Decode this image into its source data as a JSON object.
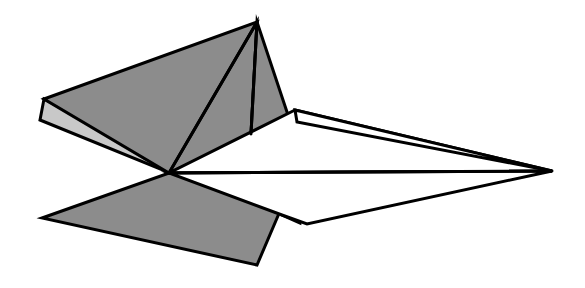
{
  "figure": {
    "style": "flat-shaded polygonal line drawing",
    "canvas": {
      "width": 585,
      "height": 288,
      "background": "#ffffff"
    },
    "palette": {
      "outline": "#000000",
      "shade_dark": "#8c8c8c",
      "shade_light": "#c8c8c8",
      "shade_white": "#ffffff"
    },
    "stroke_width": 3.0,
    "shapes": [
      {
        "name": "under-flap-light-sliver",
        "label": "Under flap (light gray sliver)",
        "fill": "#c8c8c8",
        "stroke": "#000000",
        "stroke_width": 3.0,
        "points": "40,120 170,173 174,168 44,99"
      },
      {
        "name": "upper-left-wing-dark",
        "label": "Upper left wing (dark gray)",
        "fill": "#8c8c8c",
        "stroke": "#000000",
        "stroke_width": 3.0,
        "points": "44,99 257,22 214,128 169,173"
      },
      {
        "name": "center-fin-left-panel",
        "label": "Center fin left panel (dark gray)",
        "fill": "#8c8c8c",
        "stroke": "#000000",
        "stroke_width": 3.0,
        "points": "257,22 251,134 169,173"
      },
      {
        "name": "center-fin-right-panel",
        "label": "Center fin right panel (dark gray)",
        "fill": "#8c8c8c",
        "stroke": "#000000",
        "stroke_width": 3.0,
        "points": "257,22 291,124 251,134"
      },
      {
        "name": "fin-tail-dark-wedge",
        "label": "Fin tail wedge below wing (dark gray)",
        "fill": "#8c8c8c",
        "stroke": "#000000",
        "stroke_width": 3.0,
        "points": "283,176 305,176 300,223 282,215"
      },
      {
        "name": "lower-left-wing-dark",
        "label": "Lower left wing (dark gray)",
        "fill": "#8c8c8c",
        "stroke": "#000000",
        "stroke_width": 3.0,
        "points": "169,173 295,176 257,265 42,218"
      },
      {
        "name": "white-upper-body",
        "label": "Upper white body panel",
        "fill": "#ffffff",
        "stroke": "#000000",
        "stroke_width": 3.0,
        "points": "295,110 552,171 169,173"
      },
      {
        "name": "white-nose-strip",
        "label": "White nose leading strip",
        "fill": "#ffffff",
        "stroke": "#000000",
        "stroke_width": 3.0,
        "points": "295,110 552,171 297,122"
      },
      {
        "name": "white-lower-body",
        "label": "Lower white body panel",
        "fill": "#ffffff",
        "stroke": "#000000",
        "stroke_width": 3.0,
        "points": "169,173 552,171 307,224 282,215"
      }
    ],
    "creases": [
      {
        "name": "fin-left-crease",
        "label": "Fin left crease",
        "path": "M 257,22 L 169,173",
        "stroke_width": 3.0
      },
      {
        "name": "fin-middle-crease",
        "label": "Fin middle crease",
        "path": "M 257,22 L 251,134",
        "stroke_width": 3.0
      },
      {
        "name": "fuselage-center-line",
        "label": "Fuselage center line",
        "path": "M 169,173 L 552,171",
        "stroke_width": 3.0
      }
    ],
    "vertices": [
      {
        "name": "apex",
        "label": "Top fin apex",
        "x": 257,
        "y": 22
      },
      {
        "name": "upper-left-tip",
        "label": "Upper left wing tip",
        "x": 44,
        "y": 99
      },
      {
        "name": "under-flap-tip",
        "label": "Under flap tip",
        "x": 40,
        "y": 120
      },
      {
        "name": "center-junction",
        "label": "Center junction",
        "x": 169,
        "y": 173
      },
      {
        "name": "lower-left-tip",
        "label": "Lower left wing tip",
        "x": 42,
        "y": 218
      },
      {
        "name": "lower-wing-corner",
        "label": "Lower wing bottom corner",
        "x": 257,
        "y": 265
      },
      {
        "name": "nose-tip",
        "label": "Nose tip",
        "x": 552,
        "y": 171
      },
      {
        "name": "wing-shoulder",
        "label": "White wing shoulder",
        "x": 295,
        "y": 110
      },
      {
        "name": "tail-notch",
        "label": "Lower body notch",
        "x": 307,
        "y": 224
      },
      {
        "name": "fin-foot",
        "label": "Fin middle crease foot",
        "x": 251,
        "y": 134
      }
    ]
  }
}
